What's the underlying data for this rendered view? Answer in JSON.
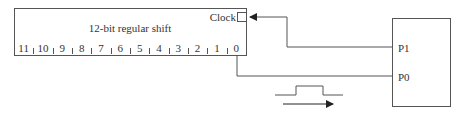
{
  "register": {
    "title": "12-bit regular shift",
    "clock_label": "Clock",
    "bits": [
      "11",
      "10",
      "9",
      "8",
      "7",
      "6",
      "5",
      "4",
      "3",
      "2",
      "1",
      "0"
    ]
  },
  "controller": {
    "ports": {
      "p1": "P1",
      "p0": "P0"
    }
  },
  "colors": {
    "line": "#555555",
    "text": "#333333"
  }
}
